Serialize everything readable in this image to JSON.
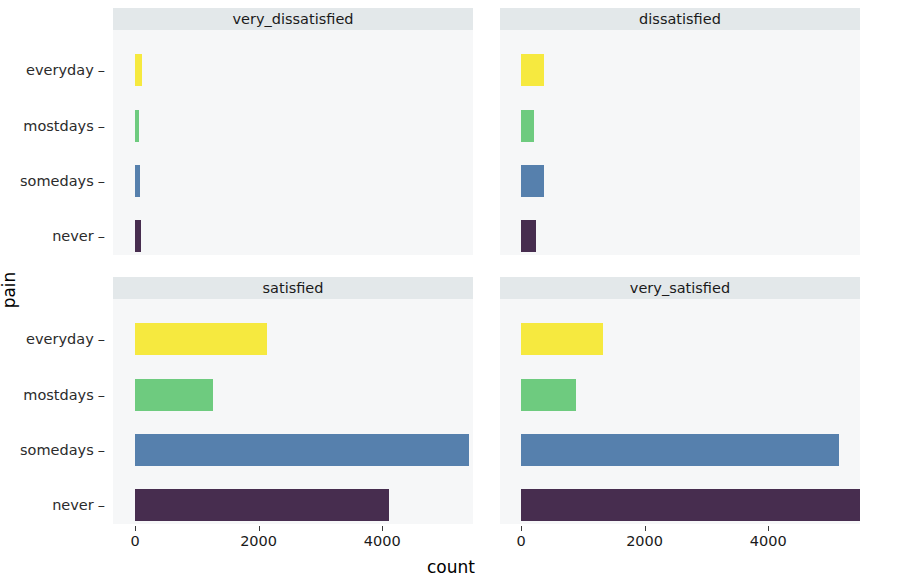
{
  "chart_data": {
    "type": "bar",
    "title": "",
    "xlabel": "count",
    "ylabel": "pain",
    "orientation": "horizontal",
    "facet_variable": "satisfaction",
    "facet_layout": "2x2",
    "categories": [
      "everyday",
      "mostdays",
      "somedays",
      "never"
    ],
    "xlim": [
      0,
      6000
    ],
    "xticks": [
      0,
      2000,
      4000,
      6000
    ],
    "xticklabels": [
      "0",
      "2000",
      "4000",
      "6000"
    ],
    "grid": false,
    "legend": "none",
    "colors": {
      "everyday": "#f6e93f",
      "mostdays": "#6ecb7f",
      "somedays": "#5680ad",
      "never": "#472d4f",
      "strip_background": "#e3e8ea",
      "panel_background": "#f6f7f8",
      "text": "#1a1a1a"
    },
    "panels": [
      {
        "label": "very_dissatisfied",
        "row": 0,
        "col": 0,
        "values": [
          110,
          35,
          85,
          95
        ],
        "series": [
          {
            "name": "everyday",
            "value": 110
          },
          {
            "name": "mostdays",
            "value": 35
          },
          {
            "name": "somedays",
            "value": 85
          },
          {
            "name": "never",
            "value": 95
          }
        ]
      },
      {
        "label": "dissatisfied",
        "row": 0,
        "col": 1,
        "values": [
          372,
          210,
          372,
          243
        ],
        "series": [
          {
            "name": "everyday",
            "value": 372
          },
          {
            "name": "mostdays",
            "value": 210
          },
          {
            "name": "somedays",
            "value": 372
          },
          {
            "name": "never",
            "value": 243
          }
        ]
      },
      {
        "label": "satisfied",
        "row": 1,
        "col": 0,
        "values": [
          2140,
          1260,
          5400,
          4110
        ],
        "series": [
          {
            "name": "everyday",
            "value": 2140
          },
          {
            "name": "mostdays",
            "value": 1260
          },
          {
            "name": "somedays",
            "value": 5400
          },
          {
            "name": "never",
            "value": 4110
          }
        ]
      },
      {
        "label": "very_satisfied",
        "row": 1,
        "col": 1,
        "values": [
          1330,
          890,
          5150,
          5540
        ],
        "series": [
          {
            "name": "everyday",
            "value": 1330
          },
          {
            "name": "mostdays",
            "value": 890
          },
          {
            "name": "somedays",
            "value": 5150
          },
          {
            "name": "never",
            "value": 5540
          }
        ]
      }
    ]
  },
  "axes": {
    "ylabel": "pain",
    "xlabel": "count",
    "ycategories": [
      "everyday",
      "mostdays",
      "somedays",
      "never"
    ],
    "xticklabels": [
      "0",
      "2000",
      "4000",
      "6000"
    ]
  },
  "strips": {
    "top_left": "very_dissatisfied",
    "top_right": "dissatisfied",
    "bottom_left": "satisfied",
    "bottom_right": "very_satisfied"
  }
}
